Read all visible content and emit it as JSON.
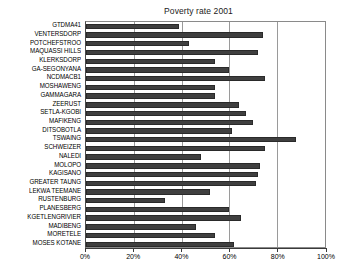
{
  "chart_data": {
    "type": "bar",
    "orientation": "horizontal",
    "title": "Poverty rate 2001",
    "xlabel": "",
    "ylabel": "",
    "xlim": [
      0,
      100
    ],
    "xunit": "%",
    "grid": true,
    "legend": "none",
    "xticks": [
      "0%",
      "20%",
      "40%",
      "60%",
      "80%",
      "100%"
    ],
    "xtick_values": [
      0,
      20,
      40,
      60,
      80,
      100
    ],
    "categories": [
      "GTDMA41",
      "VENTERSDORP",
      "POTCHEFSTROO",
      "MAQUASSI HILLS",
      "KLERKSDORP",
      "GA-SEGONYANA",
      "NCDMACB1",
      "MOSHAWENG",
      "GAMMAGARA",
      "ZEERUST",
      "SETLA-KGOBI",
      "MAFIKENG",
      "DITSOBOTLA",
      "TSWAING",
      "SCHWEIZER",
      "NALEDI",
      "MOLOPO",
      "KAGISANO",
      "GREATER TAUNG",
      "LEKWA TEEMANE",
      "RUSTENBURG",
      "PLANESBERG",
      "KGETLENGRIVIER",
      "MADIBENG",
      "MORETELE",
      "MOSES KOTANE"
    ],
    "values": [
      39,
      74,
      43,
      72,
      54,
      60,
      75,
      54,
      54,
      64,
      67,
      70,
      61,
      88,
      75,
      48,
      73,
      72,
      71,
      52,
      33,
      60,
      65,
      46,
      54,
      62
    ],
    "bar_color": "#3f3f3f"
  }
}
